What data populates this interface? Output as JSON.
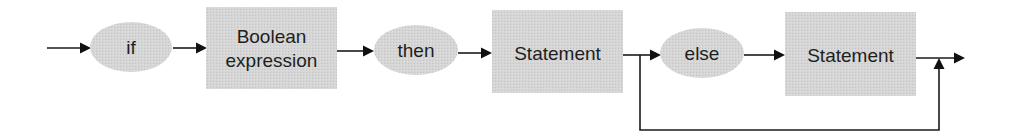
{
  "diagram": {
    "type": "syntax-diagram",
    "nodes": {
      "if": {
        "label": "if",
        "shape": "ellipse"
      },
      "boolean_expression": {
        "label_line1": "Boolean",
        "label_line2": "expression",
        "shape": "rectangle"
      },
      "then": {
        "label": "then",
        "shape": "ellipse"
      },
      "statement1": {
        "label": "Statement",
        "shape": "rectangle"
      },
      "else": {
        "label": "else",
        "shape": "ellipse"
      },
      "statement2": {
        "label": "Statement",
        "shape": "rectangle"
      }
    },
    "edges": [
      {
        "from": "start",
        "to": "if"
      },
      {
        "from": "if",
        "to": "boolean_expression"
      },
      {
        "from": "boolean_expression",
        "to": "then"
      },
      {
        "from": "then",
        "to": "statement1"
      },
      {
        "from": "statement1",
        "to": "else"
      },
      {
        "from": "else",
        "to": "statement2"
      },
      {
        "from": "statement2",
        "to": "end"
      },
      {
        "from": "statement1",
        "to": "end",
        "note": "bypass (optional else)"
      }
    ],
    "colors": {
      "shape_fill": "#d3d3d3",
      "text": "#1e1e1e",
      "line": "#1a1a1a",
      "background": "#ffffff"
    }
  }
}
